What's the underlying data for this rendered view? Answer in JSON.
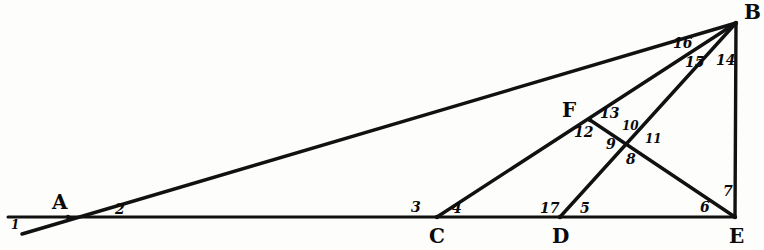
{
  "figure": {
    "stroke_color": "#111111",
    "background_color": "#fdfdfb",
    "points": [
      {
        "name": "A",
        "label": "A",
        "x": 68,
        "y": 217,
        "label_x": 52,
        "label_y": 192
      },
      {
        "name": "B",
        "label": "B",
        "x": 736,
        "y": 23,
        "label_x": 744,
        "label_y": 2
      },
      {
        "name": "C",
        "label": "C",
        "x": 437,
        "y": 217,
        "label_x": 429,
        "label_y": 226
      },
      {
        "name": "D",
        "label": "D",
        "x": 560,
        "y": 217,
        "label_x": 552,
        "label_y": 226
      },
      {
        "name": "E",
        "label": "E",
        "x": 735,
        "y": 217,
        "label_x": 729,
        "label_y": 226
      },
      {
        "name": "F",
        "label": "F",
        "x": 590,
        "y": 120,
        "label_x": 562,
        "label_y": 100
      },
      {
        "name": "X",
        "label": "",
        "x": 625,
        "y": 143,
        "label_x": 0,
        "label_y": 0
      }
    ],
    "segments": [
      {
        "name": "baseline-left-to-E",
        "x1": 8,
        "y1": 217,
        "x2": 735,
        "y2": 217,
        "width": 3.0
      },
      {
        "name": "line-through-A-to-B",
        "x1": 22,
        "y1": 234,
        "x2": 736,
        "y2": 23,
        "width": 3.4
      },
      {
        "name": "segment-C-to-B",
        "x1": 437,
        "y1": 217,
        "x2": 736,
        "y2": 23,
        "width": 3.4
      },
      {
        "name": "segment-D-to-B",
        "x1": 560,
        "y1": 217,
        "x2": 736,
        "y2": 23,
        "width": 3.4
      },
      {
        "name": "segment-F-to-E",
        "x1": 590,
        "y1": 120,
        "x2": 735,
        "y2": 217,
        "width": 3.4
      },
      {
        "name": "segment-B-to-E",
        "x1": 736,
        "y1": 23,
        "x2": 735,
        "y2": 217,
        "width": 3.4
      }
    ],
    "angle_labels": [
      {
        "name": "angle-1",
        "text": "1",
        "x": 11,
        "y": 219,
        "size": "small"
      },
      {
        "name": "angle-2",
        "text": "2",
        "x": 115,
        "y": 202,
        "size": "normal"
      },
      {
        "name": "angle-3",
        "text": "3",
        "x": 411,
        "y": 200,
        "size": "normal"
      },
      {
        "name": "angle-4",
        "text": "4",
        "x": 452,
        "y": 201,
        "size": "normal"
      },
      {
        "name": "angle-5",
        "text": "5",
        "x": 580,
        "y": 201,
        "size": "normal"
      },
      {
        "name": "angle-6",
        "text": "6",
        "x": 700,
        "y": 200,
        "size": "normal"
      },
      {
        "name": "angle-7",
        "text": "7",
        "x": 723,
        "y": 184,
        "size": "normal"
      },
      {
        "name": "angle-8",
        "text": "8",
        "x": 626,
        "y": 152,
        "size": "normal"
      },
      {
        "name": "angle-9",
        "text": "9",
        "x": 606,
        "y": 137,
        "size": "normal"
      },
      {
        "name": "angle-10",
        "text": "10",
        "x": 622,
        "y": 120,
        "size": "small"
      },
      {
        "name": "angle-11",
        "text": "11",
        "x": 645,
        "y": 133,
        "size": "small"
      },
      {
        "name": "angle-12",
        "text": "12",
        "x": 574,
        "y": 125,
        "size": "normal"
      },
      {
        "name": "angle-13",
        "text": "13",
        "x": 600,
        "y": 106,
        "size": "normal"
      },
      {
        "name": "angle-14",
        "text": "14",
        "x": 716,
        "y": 53,
        "size": "normal"
      },
      {
        "name": "angle-15",
        "text": "15",
        "x": 685,
        "y": 55,
        "size": "normal"
      },
      {
        "name": "angle-16",
        "text": "16",
        "x": 673,
        "y": 36,
        "size": "normal"
      },
      {
        "name": "angle-17",
        "text": "17",
        "x": 540,
        "y": 201,
        "size": "normal"
      }
    ]
  }
}
